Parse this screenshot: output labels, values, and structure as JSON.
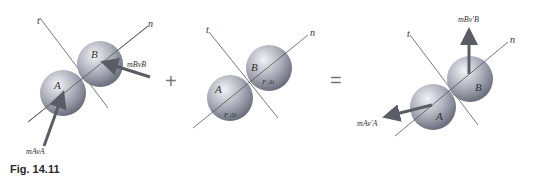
{
  "caption": "Fig. 14.11",
  "operators": {
    "plus": "+",
    "equals": "="
  },
  "diagrams": [
    {
      "name": "before-impact",
      "axis_t": "t",
      "axis_n": "n",
      "sphere_a": "A",
      "sphere_b": "B",
      "vector_a": "mAvA",
      "vector_b": "mBvB"
    },
    {
      "name": "impulse",
      "axis_t": "t",
      "axis_n": "n",
      "sphere_a": "A",
      "sphere_b": "B",
      "impulse_a": "F Δt",
      "impulse_b": "F Δt"
    },
    {
      "name": "after-impact",
      "axis_t": "t",
      "axis_n": "n",
      "sphere_a": "A",
      "sphere_b": "B",
      "vector_a": "mAv'A",
      "vector_b": "mBv'B"
    }
  ],
  "colors": {
    "sphere_light": "#e6e8ee",
    "sphere_dark": "#6d7080",
    "arrow": "#5b5d66",
    "line": "#555555"
  }
}
